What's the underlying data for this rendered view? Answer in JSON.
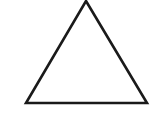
{
  "canvas": {
    "width": 155,
    "height": 117,
    "background_color": "#ffffff",
    "description": "Scanned line drawing of a single hollow triangle"
  },
  "figure": {
    "name": "triangle",
    "shape_type": "triangle",
    "label": "Triangle",
    "fill": "none",
    "fill_color": "#ffffff",
    "stroke_color": "#1a1a1a",
    "stroke_width": 2.6,
    "orientation": "apex-up",
    "classification": "isosceles",
    "clipped_at_top": true,
    "vertices": [
      {
        "name": "apex",
        "x": 86,
        "y": 1
      },
      {
        "name": "bottom-right",
        "x": 147,
        "y": 103
      },
      {
        "name": "bottom-left",
        "x": 26,
        "y": 103
      }
    ],
    "points_attr": "86,1 147,103 26,103",
    "edges": [
      {
        "name": "left-edge",
        "from": "apex",
        "to": "bottom-left"
      },
      {
        "name": "right-edge",
        "from": "apex",
        "to": "bottom-right"
      },
      {
        "name": "base-edge",
        "from": "bottom-left",
        "to": "bottom-right"
      }
    ],
    "base_width_px": 121,
    "height_px": 102
  }
}
